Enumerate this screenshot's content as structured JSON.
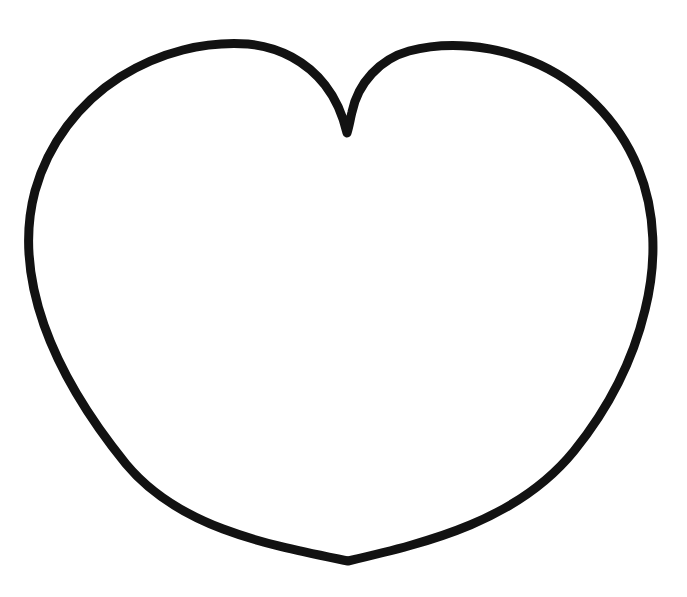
{
  "image": {
    "subject": "heart-outline",
    "description": "Hand-drawn open heart shape outline, black line art on white background",
    "style": "line-art",
    "canvas": {
      "width": 687,
      "height": 597,
      "background_color": "#ffffff"
    }
  },
  "shape": {
    "name": "heart-outline",
    "stroke_color": "#121212",
    "stroke_width": 9,
    "fill": "none",
    "bounds": {
      "left": 29,
      "right": 649,
      "top": 44,
      "bottom": 563
    },
    "anchors": {
      "cleft_notch": {
        "x": 347,
        "y": 133
      },
      "left_lobe_peak": {
        "x": 205,
        "y": 48
      },
      "right_lobe_peak": {
        "x": 496,
        "y": 51
      },
      "left_extreme": {
        "x": 30,
        "y": 281
      },
      "right_extreme": {
        "x": 648,
        "y": 276
      },
      "bottom_tip": {
        "x": 348,
        "y": 561
      }
    },
    "path": "M 347 133 C 343 116 336 99 325 85 C 307 62 280 47 248 44 C 205 41 160 52 120 77 C 79 103 48 144 35 191 C 23 236 29 282 44 325 C 62 376 92 422 126 464 C 180 529 270 545 348 561 C 430 542 518 520 574 451 C 608 409 633 360 645 310 C 657 262 656 212 638 168 C 618 119 578 80 531 61 C 492 45 447 41 409 51 C 380 59 358 83 352 112 C 350 120 349 127 347 133 Z"
  }
}
